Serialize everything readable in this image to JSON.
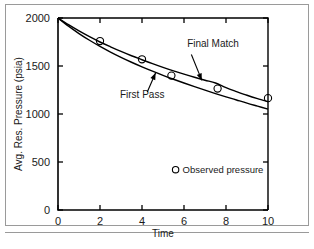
{
  "figure": {
    "background_color": "#ffffff",
    "frame_color": "#9a9a9a",
    "ink_color": "#000000"
  },
  "chart_data": {
    "type": "line",
    "title": "",
    "subtitle": "",
    "xlabel": "Time",
    "ylabel": "Avg. Res. Pressure (psia)",
    "xlim": [
      0,
      10
    ],
    "ylim": [
      0,
      2000
    ],
    "xticks": [
      0,
      2,
      4,
      6,
      8,
      10
    ],
    "xtick_labels": [
      "0",
      "2",
      "4",
      "6",
      "8",
      "10"
    ],
    "yticks": [
      0,
      500,
      1000,
      1500,
      2000
    ],
    "ytick_labels": [
      "0",
      "500",
      "1000",
      "1500",
      "2000"
    ],
    "grid": false,
    "legend_position": "inside-lower-right",
    "series": [
      {
        "name": "Final Match",
        "kind": "line",
        "x": [
          0.0,
          0.5,
          1.0,
          1.5,
          2.0,
          2.5,
          3.0,
          3.5,
          4.0,
          4.5,
          5.0,
          5.5,
          6.0,
          6.5,
          7.0,
          7.5,
          8.0,
          8.5,
          9.0,
          9.5,
          10.0
        ],
        "y": [
          2000,
          1930,
          1865,
          1805,
          1750,
          1700,
          1652,
          1607,
          1565,
          1524,
          1486,
          1450,
          1416,
          1383,
          1352,
          1323,
          1275,
          1234,
          1195,
          1160,
          1128
        ]
      },
      {
        "name": "First Pass",
        "kind": "line",
        "x": [
          0.0,
          0.5,
          1.0,
          1.5,
          2.0,
          2.5,
          3.0,
          3.5,
          4.0,
          4.5,
          5.0,
          5.5,
          6.0,
          6.5,
          7.0,
          7.5,
          8.0,
          8.5,
          9.0,
          9.5,
          10.0
        ],
        "y": [
          2000,
          1915,
          1838,
          1768,
          1704,
          1645,
          1590,
          1539,
          1491,
          1446,
          1403,
          1362,
          1323,
          1285,
          1248,
          1213,
          1179,
          1146,
          1113,
          1082,
          1051
        ]
      },
      {
        "name": "Observed pressure",
        "kind": "scatter",
        "marker": "open-circle",
        "x": [
          2.0,
          4.0,
          5.4,
          7.6,
          10.0
        ],
        "y": [
          1760,
          1570,
          1400,
          1265,
          1165
        ]
      }
    ],
    "annotations": [
      {
        "name": "final-match",
        "text": "Final Match",
        "label_x": 6.15,
        "label_y": 1700,
        "arrow_from_x": 6.35,
        "arrow_from_y": 1620,
        "arrow_to_x": 6.85,
        "arrow_to_y": 1350
      },
      {
        "name": "first-pass",
        "text": "First Pass",
        "label_x": 2.95,
        "label_y": 1170,
        "arrow_from_x": 4.25,
        "arrow_from_y": 1230,
        "arrow_to_x": 4.65,
        "arrow_to_y": 1430
      }
    ],
    "legend": [
      {
        "marker": "open-circle",
        "label": "Observed pressure",
        "x": 5.6,
        "y": 420
      }
    ]
  }
}
